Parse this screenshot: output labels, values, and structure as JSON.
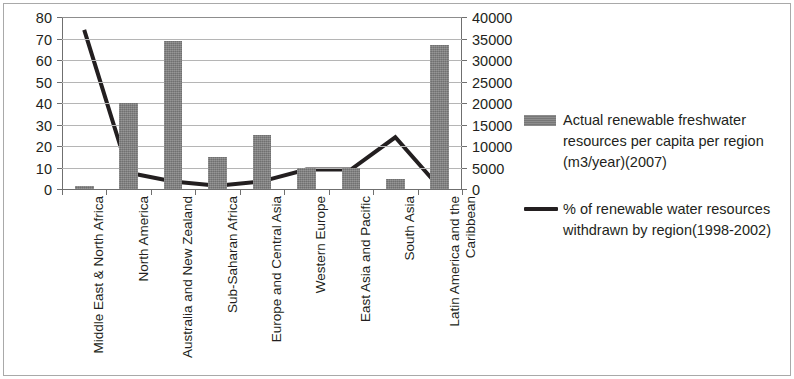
{
  "chart_data": {
    "type": "bar",
    "title": "",
    "xlabel": "",
    "ylabel": "",
    "grid": true,
    "legend_position": "right",
    "categories": [
      "Middle East & North Africa",
      "North America",
      "Australia and New Zealand",
      "Sub-Saharan Africa",
      "Europe and Central Asia",
      "Western Europe",
      "East Asia and Pacific",
      "South Asia",
      "Latin America and the Caribbean"
    ],
    "series": [
      {
        "name": "Actual renewable freshwater resources per capita per region (m3/year)(2007)",
        "type": "bar",
        "axis": "right",
        "values": [
          750,
          20000,
          34500,
          7500,
          12500,
          5000,
          5000,
          2250,
          33500
        ]
      },
      {
        "name": "% of renewable water resources withdrawn by region(1998-2002)",
        "type": "line",
        "axis": "left",
        "values": [
          74.5,
          8,
          4,
          2,
          4,
          9.5,
          9.5,
          24.5,
          1
        ]
      }
    ],
    "y_left": {
      "min": 0,
      "max": 80,
      "step": 10,
      "ticks": [
        "0",
        "10",
        "20",
        "30",
        "40",
        "50",
        "60",
        "70",
        "80"
      ]
    },
    "y_right": {
      "min": 0,
      "max": 40000,
      "step": 5000,
      "ticks": [
        "0",
        "5000",
        "10000",
        "15000",
        "20000",
        "25000",
        "30000",
        "35000",
        "40000"
      ]
    },
    "colors": {
      "bar": "#808080",
      "line": "#231f20",
      "gridline": "#b5b5b5",
      "axis": "#6f6f6f",
      "text": "#231f20",
      "background": "#ffffff"
    }
  },
  "legend": {
    "entries": [
      {
        "marker": "bar-swatch",
        "label": "Actual renewable freshwater resources per capita per region (m3/year)(2007)"
      },
      {
        "marker": "line-swatch",
        "label": "% of renewable water resources withdrawn by region(1998-2002)"
      }
    ]
  }
}
